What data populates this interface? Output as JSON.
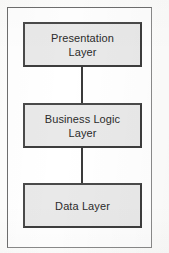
{
  "diagram": {
    "type": "flow-diagram",
    "orientation": "vertical",
    "frame": {
      "border_color": "#6e6e6e",
      "background_color": "#ffffff"
    },
    "box_style": {
      "fill_color": "#e9e9e9",
      "border_color": "#4a4a4a",
      "text_color": "#2b2b2b"
    },
    "connector_style": {
      "color": "#3a3a3a",
      "style": "solid-line",
      "arrowheads": "none"
    },
    "nodes": [
      {
        "id": "presentation",
        "label": "Presentation\nLayer",
        "label_line_1": "Presentation",
        "label_line_2": "Layer",
        "order": 1
      },
      {
        "id": "business",
        "label": "Business Logic\nLayer",
        "label_line_1": "Business Logic",
        "label_line_2": "Layer",
        "order": 2
      },
      {
        "id": "data",
        "label": "Data Layer",
        "label_line_1": "Data Layer",
        "label_line_2": "",
        "order": 3
      }
    ],
    "connectors": [
      {
        "id": "presentation-business",
        "from": "presentation",
        "to": "business"
      },
      {
        "id": "business-data",
        "from": "business",
        "to": "data"
      }
    ]
  }
}
